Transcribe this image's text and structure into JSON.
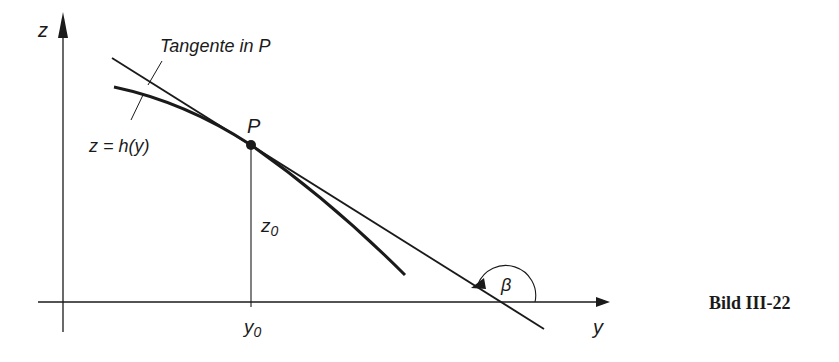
{
  "figure": {
    "caption": "Bild III-22",
    "axes": {
      "horizontal_label": "y",
      "vertical_label": "z"
    },
    "labels": {
      "tangent": "Tangente in P",
      "curve": "z = h(y)",
      "point": "P",
      "y0_base": "y",
      "y0_sub": "0",
      "z0_base": "z",
      "z0_sub": "0",
      "angle": "β"
    },
    "colors": {
      "ink": "#1a1a1a",
      "background": "#ffffff"
    }
  }
}
